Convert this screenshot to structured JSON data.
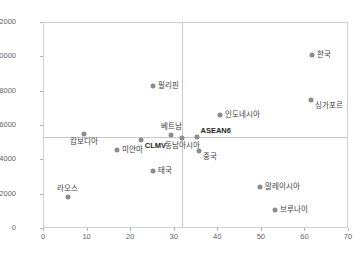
{
  "chart_data": {
    "type": "scatter",
    "title": "",
    "xlabel": "",
    "ylabel": "",
    "xlim": [
      0,
      70
    ],
    "ylim": [
      0,
      12000
    ],
    "xticks": [
      0,
      10,
      20,
      30,
      40,
      50,
      60,
      70
    ],
    "yticks": [
      0,
      2000,
      4000,
      6000,
      8000,
      10000,
      12000
    ],
    "grid": false,
    "legend": "none",
    "marker_color": "#8c8c8c",
    "reference_lines": {
      "horizontal_y": 5370,
      "vertical_x": 31.7,
      "color": "#c9c9c9"
    },
    "points": [
      {
        "label": "한국",
        "x": 61.5,
        "y": 10150,
        "label_pos": "right",
        "bold": false
      },
      {
        "label": "싱가포르",
        "x": 61.3,
        "y": 7540,
        "label_pos": "below-right",
        "bold": false
      },
      {
        "label": "필리핀",
        "x": 25.0,
        "y": 8330,
        "label_pos": "right",
        "bold": false
      },
      {
        "label": "인도네시아",
        "x": 40.3,
        "y": 6620,
        "label_pos": "right",
        "bold": false
      },
      {
        "label": "베트남",
        "x": 29.2,
        "y": 5480,
        "label_pos": "above",
        "bold": false
      },
      {
        "label": "ASEAN6",
        "x": 35.0,
        "y": 5380,
        "label_pos": "above-right",
        "bold": true
      },
      {
        "label": "동남아시아",
        "x": 31.7,
        "y": 5320,
        "label_pos": "below",
        "bold": false
      },
      {
        "label": "CLMV",
        "x": 22.2,
        "y": 5160,
        "label_pos": "below-right",
        "bold": true
      },
      {
        "label": "캄보디아",
        "x": 9.2,
        "y": 5540,
        "label_pos": "below",
        "bold": false
      },
      {
        "label": "미얀마",
        "x": 16.8,
        "y": 4620,
        "label_pos": "right",
        "bold": false
      },
      {
        "label": "중국",
        "x": 35.6,
        "y": 4570,
        "label_pos": "below-right",
        "bold": false
      },
      {
        "label": "태국",
        "x": 25.0,
        "y": 3370,
        "label_pos": "right",
        "bold": false
      },
      {
        "label": "말레이시아",
        "x": 49.5,
        "y": 2470,
        "label_pos": "right",
        "bold": false
      },
      {
        "label": "브루나이",
        "x": 53.0,
        "y": 1120,
        "label_pos": "right",
        "bold": false
      },
      {
        "label": "라오스",
        "x": 5.5,
        "y": 1870,
        "label_pos": "above",
        "bold": false
      }
    ]
  }
}
